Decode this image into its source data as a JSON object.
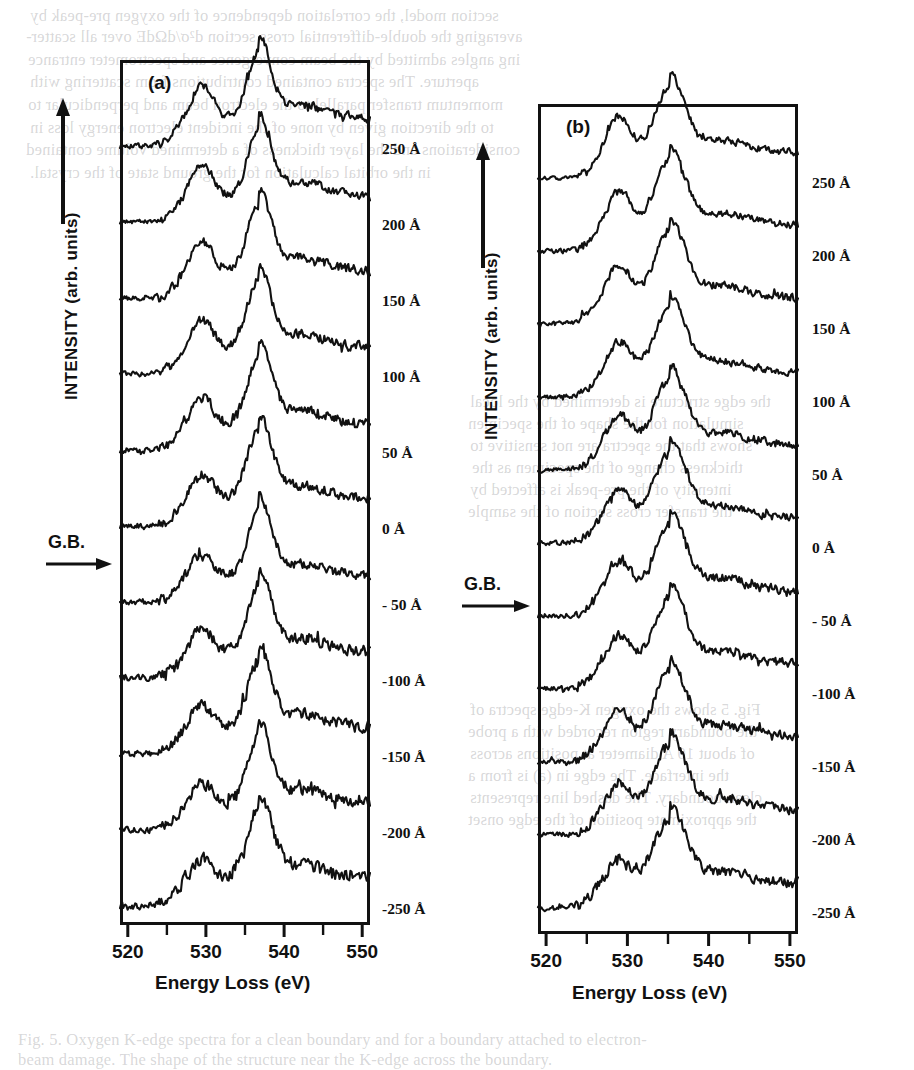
{
  "figure": {
    "caption_visible": false,
    "panels": [
      {
        "id": "a",
        "letter": "(a)",
        "gb_label": "G.B.",
        "gb_arrow": "right-arrow",
        "axes": {
          "ylabel": "INTENSITY (arb. units)",
          "y_arrow": "up-arrow",
          "xlabel": "Energy Loss (eV)",
          "xticks": [
            520,
            530,
            540,
            550
          ],
          "xtick_labels": [
            "520",
            "530",
            "540",
            "550"
          ],
          "xlim": [
            519.0,
            551.0
          ],
          "minor_tick_step": 5
        },
        "traces": [
          {
            "label": "250 Å",
            "offset": 0
          },
          {
            "label": "200 Å",
            "offset": 1
          },
          {
            "label": "150 Å",
            "offset": 2
          },
          {
            "label": "100 Å",
            "offset": 3
          },
          {
            "label": "50 Å",
            "offset": 4
          },
          {
            "label": "0 Å",
            "offset": 5
          },
          {
            "label": "- 50 Å",
            "offset": 6
          },
          {
            "label": "-100 Å",
            "offset": 7
          },
          {
            "label": "-150 Å",
            "offset": 8
          },
          {
            "label": "-200 Å",
            "offset": 9
          },
          {
            "label": "-250 Å",
            "offset": 10
          }
        ]
      },
      {
        "id": "b",
        "letter": "(b)",
        "gb_label": "G.B.",
        "gb_arrow": "right-arrow",
        "axes": {
          "ylabel": "INTENSITY (arb. units)",
          "y_arrow": "up-arrow",
          "xlabel": "Energy Loss (eV)",
          "xticks": [
            520,
            530,
            540,
            550
          ],
          "xtick_labels": [
            "520",
            "530",
            "540",
            "550"
          ],
          "xlim": [
            519.0,
            551.0
          ],
          "minor_tick_step": 5
        },
        "traces": [
          {
            "label": "250 Å",
            "offset": 0
          },
          {
            "label": "200 Å",
            "offset": 1
          },
          {
            "label": "150 Å",
            "offset": 2
          },
          {
            "label": "100 Å",
            "offset": 3
          },
          {
            "label": "50 Å",
            "offset": 4
          },
          {
            "label": "0 Å",
            "offset": 5
          },
          {
            "label": "- 50 Å",
            "offset": 6
          },
          {
            "label": "-100 Å",
            "offset": 7
          },
          {
            "label": "-150 Å",
            "offset": 8
          },
          {
            "label": "-200 Å",
            "offset": 9
          },
          {
            "label": "-250 Å",
            "offset": 10
          }
        ]
      }
    ]
  },
  "chart_data": {
    "type": "line",
    "title": "",
    "xlabel": "Energy Loss (eV)",
    "ylabel": "INTENSITY (arb. units)",
    "xlim": [
      519,
      551
    ],
    "xticks": [
      520,
      530,
      540,
      550
    ],
    "grid": false,
    "legend": "right-of-axes trace labels",
    "panels": [
      {
        "name": "(a)",
        "series_labels": [
          "250 Å",
          "200 Å",
          "150 Å",
          "100 Å",
          "50 Å",
          "0 Å",
          "- 50 Å",
          "-100 Å",
          "-150 Å",
          "-200 Å",
          "-250 Å"
        ],
        "edge_onset_eV": 524.5,
        "prepeak_eV": 529.5,
        "main_peak_eV": 536.8,
        "secondary_bump_eV": 543.0,
        "prepeak_rel_height": [
          0.4,
          0.38,
          0.36,
          0.34,
          0.32,
          0.3,
          0.3,
          0.28,
          0.27,
          0.26,
          0.24
        ],
        "main_peak_rel_height": [
          1.0,
          1.0,
          1.0,
          1.0,
          1.0,
          1.0,
          1.0,
          1.0,
          1.0,
          1.0,
          1.0
        ],
        "peak_width_eV": [
          3.2,
          3.2,
          3.3,
          3.3,
          3.4,
          3.5,
          3.4,
          3.3,
          3.3,
          3.4,
          3.6
        ],
        "noise_level": [
          0.045,
          0.045,
          0.05,
          0.05,
          0.055,
          0.05,
          0.055,
          0.06,
          0.06,
          0.06,
          0.065
        ]
      },
      {
        "name": "(b)",
        "series_labels": [
          "250 Å",
          "200 Å",
          "150 Å",
          "100 Å",
          "50 Å",
          "0 Å",
          "- 50 Å",
          "-100 Å",
          "-150 Å",
          "-200 Å",
          "-250 Å"
        ],
        "edge_onset_eV": 524.0,
        "prepeak_eV": 529.0,
        "main_peak_eV": 535.2,
        "secondary_bump_eV": 542.5,
        "prepeak_rel_height": [
          0.46,
          0.44,
          0.42,
          0.4,
          0.38,
          0.36,
          0.36,
          0.35,
          0.34,
          0.33,
          0.32
        ],
        "main_peak_rel_height": [
          1.0,
          1.0,
          1.0,
          1.0,
          1.0,
          1.0,
          1.0,
          1.0,
          1.0,
          1.0,
          1.0
        ],
        "peak_width_eV": [
          4.0,
          4.0,
          4.1,
          4.2,
          4.2,
          4.3,
          4.2,
          4.1,
          4.1,
          4.2,
          4.4
        ],
        "noise_level": [
          0.04,
          0.042,
          0.045,
          0.045,
          0.048,
          0.045,
          0.05,
          0.05,
          0.055,
          0.055,
          0.06
        ]
      }
    ]
  },
  "bleed_text": {
    "lines": [
      {
        "t": "section model, the correlation dependence of the oxygen pre-peak by",
        "x": 30,
        "y": 6
      },
      {
        "t": "averaging the double-differential cross section d²σ/dΩdE over all scatter-",
        "x": 26,
        "y": 27
      },
      {
        "t": "ing angles admitted by the beam convergence and spectrometer entrance",
        "x": 28,
        "y": 50
      },
      {
        "t": "aperture. The spectra contained contributions from scattering with",
        "x": 30,
        "y": 72
      },
      {
        "t": "momentum transfer parallel to the electron beam and perpendicular to",
        "x": 28,
        "y": 95
      },
      {
        "t": "to the direction given by none of the incident electron energy loss in",
        "x": 30,
        "y": 118
      },
      {
        "t": "considerations and the layer thickness of a determined volume contained",
        "x": 26,
        "y": 140
      },
      {
        "t": "in the orbital calculation for the ground state of the crystal.",
        "x": 30,
        "y": 163
      }
    ],
    "mid_lines": [
      {
        "t": "the edge structure is determined by the local",
        "x": 470,
        "y": 392
      },
      {
        "t": "simulation for the shape of the specimen",
        "x": 468,
        "y": 414
      },
      {
        "t": "shows that the spectra are not sensitive to",
        "x": 470,
        "y": 436
      },
      {
        "t": "thickness change of the specimen as the",
        "x": 472,
        "y": 458
      },
      {
        "t": "intensity of the pre-peak is affected by",
        "x": 470,
        "y": 480
      },
      {
        "t": "the transfer cross section of the sample",
        "x": 468,
        "y": 502
      }
    ],
    "low_lines": [
      {
        "t": "Fig. 5 shows the oxygen K-edge spectra of",
        "x": 470,
        "y": 700
      },
      {
        "t": "the boundary region recorded with a probe",
        "x": 468,
        "y": 722
      },
      {
        "t": "of about 10 A diameter at positions across",
        "x": 470,
        "y": 744
      },
      {
        "t": "the interface. The edge in (a) is from a",
        "x": 468,
        "y": 766
      },
      {
        "t": "clean boundary. The dashed line represents",
        "x": 470,
        "y": 788
      },
      {
        "t": "the approximate position of the edge onset",
        "x": 468,
        "y": 810
      }
    ],
    "bottom_lines": [
      {
        "t": "Fig. 5. Oxygen K-edge spectra for a clean boundary and for a boundary attached to electron-",
        "x": 18,
        "y": 1030
      },
      {
        "t": "beam damage. The shape of the structure near the K-edge across the boundary.",
        "x": 18,
        "y": 1050
      }
    ]
  }
}
